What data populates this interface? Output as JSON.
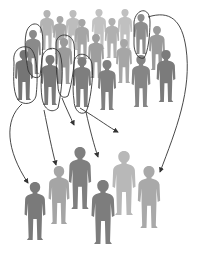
{
  "diagram": {
    "colors": {
      "background": "#ffffff",
      "outline": "#333333",
      "arrow": "#333333"
    },
    "population": [
      {
        "x": 47,
        "y": 10,
        "h": 40,
        "shade": "#b3b3b3"
      },
      {
        "x": 60,
        "y": 16,
        "h": 38,
        "shade": "#a8a8a8"
      },
      {
        "x": 73,
        "y": 10,
        "h": 40,
        "shade": "#bdbdbd"
      },
      {
        "x": 99,
        "y": 9,
        "h": 40,
        "shade": "#c2c2c2"
      },
      {
        "x": 125,
        "y": 9,
        "h": 40,
        "shade": "#c0c0c0"
      },
      {
        "x": 82,
        "y": 19,
        "h": 40,
        "shade": "#a5a5a5"
      },
      {
        "x": 112,
        "y": 18,
        "h": 40,
        "shade": "#b0b0b0"
      },
      {
        "x": 141,
        "y": 14,
        "h": 40,
        "shade": "#8e8e8e"
      },
      {
        "x": 33,
        "y": 30,
        "h": 44,
        "shade": "#8a8a8a"
      },
      {
        "x": 96,
        "y": 34,
        "h": 44,
        "shade": "#9e9e9e"
      },
      {
        "x": 124,
        "y": 39,
        "h": 44,
        "shade": "#a6a6a6"
      },
      {
        "x": 157,
        "y": 26,
        "h": 44,
        "shade": "#9a9a9a"
      },
      {
        "x": 64,
        "y": 38,
        "h": 46,
        "shade": "#9b9b9b"
      },
      {
        "x": 24,
        "y": 50,
        "h": 50,
        "shade": "#757575"
      },
      {
        "x": 50,
        "y": 55,
        "h": 50,
        "shade": "#7a7a7a"
      },
      {
        "x": 82,
        "y": 57,
        "h": 50,
        "shade": "#7e7e7e"
      },
      {
        "x": 107,
        "y": 60,
        "h": 50,
        "shade": "#808080"
      },
      {
        "x": 141,
        "y": 55,
        "h": 52,
        "shade": "#858585"
      },
      {
        "x": 166,
        "y": 50,
        "h": 52,
        "shade": "#7b7b7b"
      }
    ],
    "outlines": [
      {
        "d": "M14,62 C12,50 22,44 30,48 C38,54 38,80 36,96 C34,104 24,106 18,100 C12,90 14,74 14,62 Z"
      },
      {
        "d": "M26,34 C28,22 40,20 42,32 C44,42 42,60 40,76 C36,80 30,76 28,70 C26,58 24,44 26,34 Z"
      },
      {
        "d": "M42,60 C42,48 56,44 60,54 C64,66 62,90 58,108 C52,114 44,110 42,98 C40,84 42,72 42,60 Z"
      },
      {
        "d": "M56,44 C56,32 72,32 74,44 C76,58 72,84 68,96 C62,100 58,94 58,86 C56,72 56,56 56,44 Z"
      },
      {
        "d": "M74,64 C74,50 90,52 92,64 C94,76 90,104 86,112 C80,116 74,110 74,100 C72,88 74,76 74,64 Z"
      },
      {
        "d": "M134,22 C136,8 150,6 150,22 C150,36 148,52 144,58 C138,60 134,52 134,44 C134,36 134,28 134,22 Z"
      }
    ],
    "arrows": [
      {
        "d": "M22,104 C4,120 6,150 28,183",
        "head": [
          28,
          183
        ]
      },
      {
        "d": "M44,110 C48,130 52,150 56,165",
        "head": [
          56,
          165
        ]
      },
      {
        "d": "M62,98 C66,108 70,116 74,125",
        "head": [
          74,
          125
        ]
      },
      {
        "d": "M80,108 C100,120 110,128 118,132",
        "head": [
          118,
          132
        ]
      },
      {
        "d": "M86,112 C90,130 94,145 98,157",
        "head": [
          98,
          157
        ]
      },
      {
        "d": "M148,17 C170,10 182,20 186,48 C192,90 176,130 160,172",
        "head": [
          160,
          172
        ]
      }
    ],
    "sample": [
      {
        "x": 35,
        "y": 182,
        "h": 58,
        "shade": "#7a7a7a"
      },
      {
        "x": 59,
        "y": 166,
        "h": 58,
        "shade": "#a5a5a5"
      },
      {
        "x": 80,
        "y": 147,
        "h": 62,
        "shade": "#7f7f7f"
      },
      {
        "x": 103,
        "y": 180,
        "h": 64,
        "shade": "#7d7d7d"
      },
      {
        "x": 124,
        "y": 151,
        "h": 64,
        "shade": "#b8b8b8"
      },
      {
        "x": 149,
        "y": 166,
        "h": 62,
        "shade": "#a9a9a9"
      }
    ]
  }
}
